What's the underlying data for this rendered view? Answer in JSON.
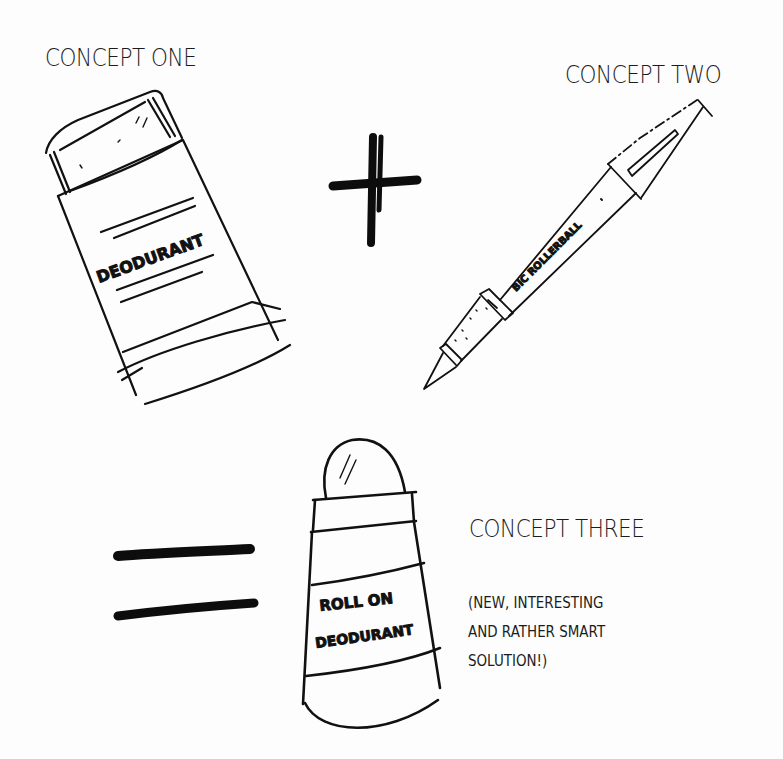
{
  "concepts": {
    "one": {
      "title": "CONCEPT ONE",
      "label": "DEODURANT",
      "object": "stick-deodorant"
    },
    "two": {
      "title": "CONCEPT TWO",
      "label": "BIC ROLLERBALL",
      "object": "rollerball-pen"
    },
    "three": {
      "title": "CONCEPT THREE",
      "label_line1": "ROLL ON",
      "label_line2": "DEODURANT",
      "object": "roll-on-deodorant",
      "note_lines": [
        "(NEW, INTERESTING",
        "AND RATHER SMART",
        "SOLUTION!)"
      ]
    }
  },
  "operators": {
    "plus": "+",
    "equals": "="
  },
  "colors": {
    "ink": "#111111",
    "paper": "#fdfdfd"
  }
}
